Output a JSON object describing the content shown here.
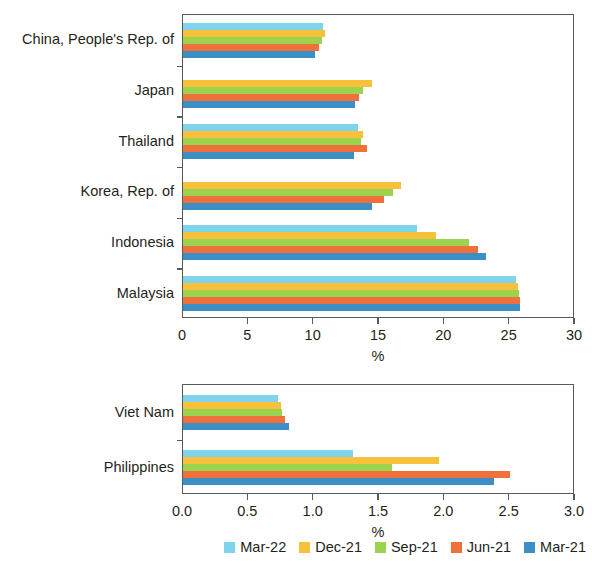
{
  "chart_data": [
    {
      "type": "bar",
      "orientation": "horizontal",
      "panel": "top",
      "title": "",
      "xlabel": "%",
      "ylabel": "",
      "xlim": [
        0,
        30
      ],
      "xticks": [
        0,
        5,
        10,
        15,
        20,
        25,
        30
      ],
      "xtick_labels": [
        "0",
        "5",
        "10",
        "15",
        "20",
        "25",
        "30"
      ],
      "grid": false,
      "categories": [
        "China, People's Rep. of",
        "Japan",
        "Thailand",
        "Korea, Rep. of",
        "Indonesia",
        "Malaysia"
      ],
      "series": [
        {
          "name": "Mar-22",
          "color": "#7FD3EB",
          "values": [
            10.7,
            null,
            13.4,
            null,
            17.9,
            25.5
          ]
        },
        {
          "name": "Dec-21",
          "color": "#F7C13C",
          "values": [
            10.9,
            14.5,
            13.8,
            16.7,
            19.4,
            25.6
          ]
        },
        {
          "name": "Sep-21",
          "color": "#9BD24E",
          "values": [
            10.6,
            13.8,
            13.6,
            16.1,
            21.9,
            25.7
          ]
        },
        {
          "name": "Jun-21",
          "color": "#F0703C",
          "values": [
            10.4,
            13.5,
            14.1,
            15.4,
            22.6,
            25.8
          ]
        },
        {
          "name": "Mar-21",
          "color": "#3C8FC4",
          "values": [
            10.1,
            13.2,
            13.1,
            14.5,
            23.2,
            25.8
          ]
        }
      ]
    },
    {
      "type": "bar",
      "orientation": "horizontal",
      "panel": "bottom",
      "title": "",
      "xlabel": "%",
      "ylabel": "",
      "xlim": [
        0.0,
        3.0
      ],
      "xticks": [
        0.0,
        0.5,
        1.0,
        1.5,
        2.0,
        2.5,
        3.0
      ],
      "xtick_labels": [
        "0.0",
        "0.5",
        "1.0",
        "1.5",
        "2.0",
        "2.5",
        "3.0"
      ],
      "grid": false,
      "categories": [
        "Viet Nam",
        "Philippines"
      ],
      "series": [
        {
          "name": "Mar-22",
          "color": "#7FD3EB",
          "values": [
            0.73,
            1.3
          ]
        },
        {
          "name": "Dec-21",
          "color": "#F7C13C",
          "values": [
            0.75,
            1.96
          ]
        },
        {
          "name": "Sep-21",
          "color": "#9BD24E",
          "values": [
            0.76,
            1.6
          ]
        },
        {
          "name": "Jun-21",
          "color": "#F0703C",
          "values": [
            0.78,
            2.5
          ]
        },
        {
          "name": "Mar-21",
          "color": "#3C8FC4",
          "values": [
            0.81,
            2.38
          ]
        }
      ]
    }
  ],
  "legend": {
    "position": "bottom-right",
    "entries": [
      {
        "label": "Mar-22",
        "color": "#7FD3EB"
      },
      {
        "label": "Dec-21",
        "color": "#F7C13C"
      },
      {
        "label": "Sep-21",
        "color": "#9BD24E"
      },
      {
        "label": "Jun-21",
        "color": "#F0703C"
      },
      {
        "label": "Mar-21",
        "color": "#3C8FC4"
      }
    ]
  }
}
